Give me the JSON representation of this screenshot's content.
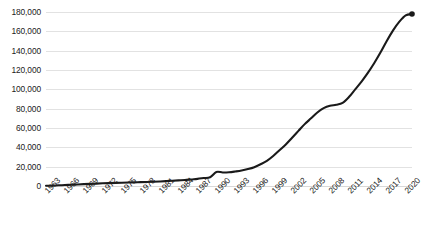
{
  "chart_data": {
    "type": "line",
    "title": "",
    "subtitle": "",
    "xlabel": "",
    "ylabel": "",
    "grid": true,
    "legend": false,
    "legend_position": "none",
    "line_color": "#1a1a1a",
    "gridline_color": "#e2e2e2",
    "ylim": [
      0,
      180000
    ],
    "ytick_step": 20000,
    "ytick_labels": [
      "180,000",
      "160,000",
      "140,000",
      "120,000",
      "100,000",
      "80,000",
      "60,000",
      "40,000",
      "20,000",
      "0"
    ],
    "ytick_values": [
      180000,
      160000,
      140000,
      120000,
      100000,
      80000,
      60000,
      40000,
      20000,
      0
    ],
    "xtick_labels": [
      "1963",
      "1966",
      "1969",
      "1972",
      "1975",
      "1978",
      "1981",
      "1984",
      "1987",
      "1990",
      "1993",
      "1996",
      "1999",
      "2002",
      "2005",
      "2008",
      "2011",
      "2014",
      "2017",
      "2020"
    ],
    "xtick_step": 3,
    "xlim": [
      1963,
      2021
    ],
    "end_marker": true,
    "end_marker_value": 178000,
    "x": [
      1963,
      1964,
      1965,
      1966,
      1967,
      1968,
      1969,
      1970,
      1971,
      1972,
      1973,
      1974,
      1975,
      1976,
      1977,
      1978,
      1979,
      1980,
      1981,
      1982,
      1983,
      1984,
      1985,
      1986,
      1987,
      1988,
      1989,
      1990,
      1991,
      1992,
      1993,
      1994,
      1995,
      1996,
      1997,
      1998,
      1999,
      2000,
      2001,
      2002,
      2003,
      2004,
      2005,
      2006,
      2007,
      2008,
      2009,
      2010,
      2011,
      2012,
      2013,
      2014,
      2015,
      2016,
      2017,
      2018,
      2019,
      2020,
      2021
    ],
    "values": [
      200,
      400,
      700,
      1000,
      1300,
      1600,
      1900,
      2200,
      2500,
      2800,
      3000,
      3200,
      3400,
      3600,
      3800,
      4000,
      4200,
      4400,
      4700,
      5000,
      5400,
      5800,
      6200,
      6800,
      7400,
      8200,
      9000,
      14500,
      14000,
      14200,
      15000,
      16000,
      17500,
      19500,
      22500,
      26000,
      31000,
      37000,
      43000,
      50000,
      57000,
      64000,
      70000,
      76000,
      80500,
      83000,
      84000,
      86000,
      92000,
      100000,
      108000,
      117000,
      127000,
      138000,
      150000,
      161000,
      170000,
      176500,
      178000
    ]
  }
}
